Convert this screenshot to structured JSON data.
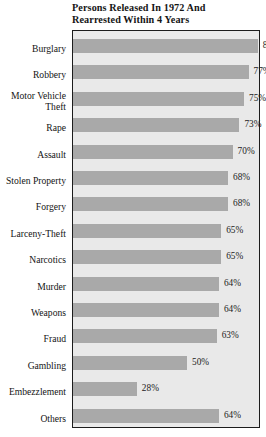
{
  "chart_data": {
    "type": "bar",
    "orientation": "horizontal",
    "title": "Persons Released In 1972 And\nRearrested Within 4 Years",
    "xlabel": "",
    "ylabel": "",
    "xlim": [
      0,
      100
    ],
    "grid": false,
    "legend": null,
    "value_suffix": "%",
    "categories": [
      "Burglary",
      "Robbery",
      "Motor Vehicle\nTheft",
      "Rape",
      "Assault",
      "Stolen Property",
      "Forgery",
      "Larceny-Theft",
      "Narcotics",
      "Murder",
      "Weapons",
      "Fraud",
      "Gambling",
      "Embezzlement",
      "Others"
    ],
    "values": [
      81,
      77,
      75,
      73,
      70,
      68,
      68,
      65,
      65,
      64,
      64,
      63,
      50,
      28,
      64
    ],
    "data_labels": [
      "81%",
      "77%",
      "75%",
      "73%",
      "70%",
      "68%",
      "68%",
      "65%",
      "65%",
      "64%",
      "64%",
      "63%",
      "50%",
      "28%",
      "64%"
    ],
    "colors": {
      "bar_fill": "#a9a9a9",
      "plot_background": "#e9e9e9",
      "page_background": "#ffffff",
      "border": "#1c1c1c",
      "text": "#141414"
    }
  }
}
